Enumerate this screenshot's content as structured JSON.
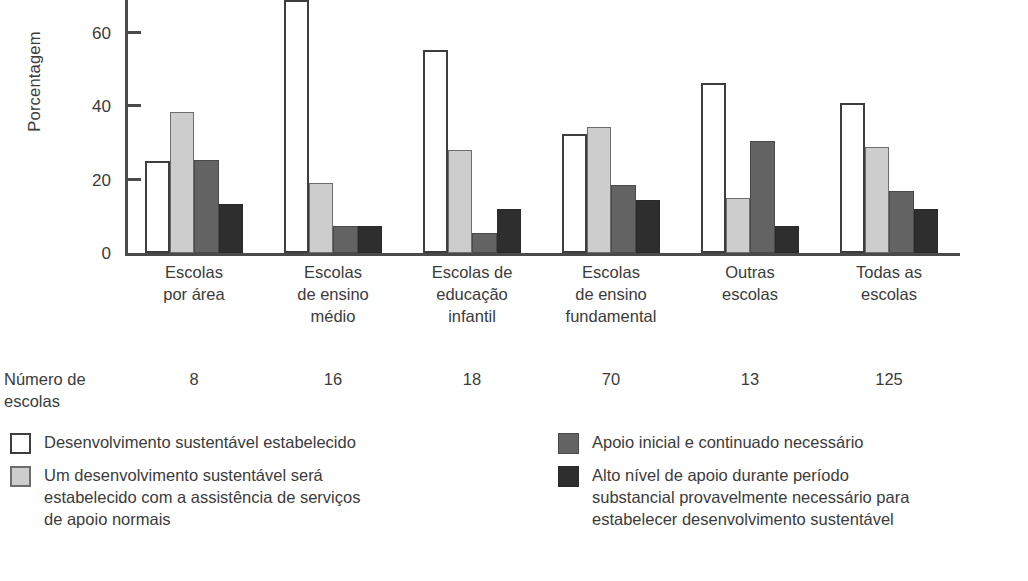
{
  "chart_data": {
    "type": "bar",
    "title": "",
    "xlabel": "",
    "ylabel": "Porcentagem",
    "ylim": [
      0,
      70
    ],
    "yticks": [
      0,
      20,
      40,
      60
    ],
    "grid": false,
    "legend_position": "bottom",
    "categories": [
      "Escolas\npor área",
      "Escolas\nde ensino\nmédio",
      "Escolas de\neducação\ninfantil",
      "Escolas\nde ensino\nfundamental",
      "Outras\nescolas",
      "Todas as\nescolas"
    ],
    "series": [
      {
        "name": "Desenvolvimento sustentável estabelecido",
        "color": "#ffffff",
        "values": [
          25,
          69,
          55.5,
          32.5,
          46.5,
          41
        ]
      },
      {
        "name": "Um desenvolvimento sustentável será estabelecido com a assistência de serviços de apoio normais",
        "color": "#cdcdcd",
        "values": [
          38.5,
          19,
          28,
          34.5,
          15,
          29
        ]
      },
      {
        "name": "Apoio inicial e continuado necessário",
        "color": "#636363",
        "values": [
          25.5,
          7.5,
          5.5,
          18.5,
          30.5,
          17
        ]
      },
      {
        "name": "Alto nível de apoio durante período substancial provavelmente necessário para estabelecer desenvolvimento sustentável",
        "color": "#2e2e2e",
        "values": [
          13.5,
          7.5,
          12,
          14.5,
          7.5,
          12
        ]
      }
    ],
    "secondary_row": {
      "label": "Número de\nescolas",
      "values": [
        8,
        16,
        18,
        70,
        13,
        125
      ]
    }
  },
  "axis": {
    "tick_labels": [
      "0",
      "20",
      "40",
      "60"
    ],
    "title": "Porcentagem"
  },
  "counts": {
    "title": "Número de\nescolas",
    "values": [
      "8",
      "16",
      "18",
      "70",
      "13",
      "125"
    ]
  },
  "legend": {
    "left": [
      {
        "swatch": "white-square-icon",
        "text": "Desenvolvimento sustentável estabelecido"
      },
      {
        "swatch": "light-gray-square-icon",
        "text": "Um desenvolvimento sustentável será\nestabelecido com a assistência de serviços\nde apoio normais"
      }
    ],
    "right": [
      {
        "swatch": "medium-gray-square-icon",
        "text": "Apoio inicial e continuado necessário"
      },
      {
        "swatch": "dark-gray-square-icon",
        "text": "Alto nível de apoio durante período\nsubstancial provavelmente necessário para\nestabelecer desenvolvimento sustentável"
      }
    ]
  },
  "caption": {
    "text": ""
  }
}
